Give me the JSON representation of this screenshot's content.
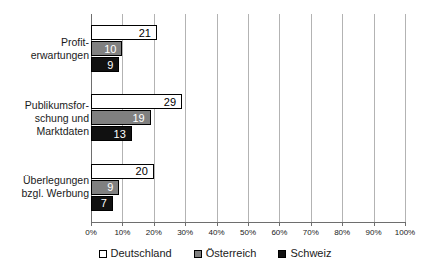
{
  "chart_data": {
    "type": "bar",
    "orientation": "horizontal",
    "title": "",
    "subtitle": "",
    "xlabel": "",
    "ylabel": "",
    "xlim": [
      0,
      100
    ],
    "xticks": [
      0,
      10,
      20,
      30,
      40,
      50,
      60,
      70,
      80,
      90,
      100
    ],
    "xtick_labels": [
      "0%",
      "10%",
      "20%",
      "30%",
      "40%",
      "50%",
      "60%",
      "70%",
      "80%",
      "90%",
      "100%"
    ],
    "grid": true,
    "grid_axis": "x",
    "legend_position": "bottom-center",
    "categories": [
      "Profit-\nerwartungen",
      "Publikumsfor-\nschung und\nMarktdaten",
      "Überlegungen\nbzgl. Werbung"
    ],
    "category_lines": [
      [
        "Profit-",
        "erwartungen"
      ],
      [
        "Publikumsfor-",
        "schung und",
        "Marktdaten"
      ],
      [
        "Überlegungen",
        "bzgl. Werbung"
      ]
    ],
    "series": [
      {
        "name": "Deutschland",
        "color": "#ffffff",
        "values": [
          21,
          29,
          20
        ]
      },
      {
        "name": "Österreich",
        "color": "#808080",
        "values": [
          10,
          19,
          9
        ]
      },
      {
        "name": "Schweiz",
        "color": "#111111",
        "values": [
          9,
          13,
          7
        ]
      }
    ],
    "value_labels": [
      [
        "21",
        "10",
        "9"
      ],
      [
        "29",
        "19",
        "13"
      ],
      [
        "20",
        "9",
        "7"
      ]
    ]
  },
  "legend": {
    "items": [
      {
        "label": "Deutschland",
        "swatch": "white-square-icon"
      },
      {
        "label": "Österreich",
        "swatch": "gray-square-icon"
      },
      {
        "label": "Schweiz",
        "swatch": "black-square-icon"
      }
    ]
  }
}
